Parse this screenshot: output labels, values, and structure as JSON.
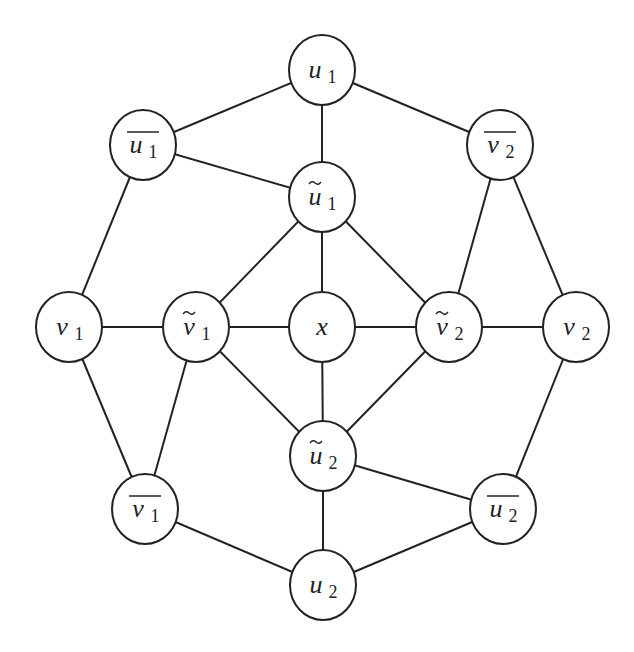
{
  "diagram": {
    "type": "graph",
    "style": {
      "edge_color": "#222222",
      "node_fill": "#ffffff",
      "node_stroke": "#222222",
      "node_radius": 33
    },
    "nodes": [
      {
        "id": "u1",
        "base": "u",
        "sub": "1",
        "decoration": "none",
        "x": 322,
        "y": 70
      },
      {
        "id": "u1bar",
        "base": "u",
        "sub": "1",
        "decoration": "bar",
        "x": 143,
        "y": 145
      },
      {
        "id": "v2bar",
        "base": "v",
        "sub": "2",
        "decoration": "bar",
        "x": 500,
        "y": 145
      },
      {
        "id": "u1tilde",
        "base": "u",
        "sub": "1",
        "decoration": "tilde",
        "x": 322,
        "y": 197
      },
      {
        "id": "v1",
        "base": "v",
        "sub": "1",
        "decoration": "none",
        "x": 69,
        "y": 327
      },
      {
        "id": "v1tilde",
        "base": "v",
        "sub": "1",
        "decoration": "tilde",
        "x": 196,
        "y": 327
      },
      {
        "id": "x",
        "base": "x",
        "sub": "",
        "decoration": "none",
        "x": 322,
        "y": 327
      },
      {
        "id": "v2tilde",
        "base": "v",
        "sub": "2",
        "decoration": "tilde",
        "x": 449,
        "y": 327
      },
      {
        "id": "v2",
        "base": "v",
        "sub": "2",
        "decoration": "none",
        "x": 576,
        "y": 327
      },
      {
        "id": "u2tilde",
        "base": "u",
        "sub": "2",
        "decoration": "tilde",
        "x": 323,
        "y": 456
      },
      {
        "id": "v1bar",
        "base": "v",
        "sub": "1",
        "decoration": "bar",
        "x": 145,
        "y": 509
      },
      {
        "id": "u2bar",
        "base": "u",
        "sub": "2",
        "decoration": "bar",
        "x": 503,
        "y": 509
      },
      {
        "id": "u2",
        "base": "u",
        "sub": "2",
        "decoration": "none",
        "x": 323,
        "y": 585
      }
    ],
    "edges": [
      [
        "u1",
        "u1bar"
      ],
      [
        "u1",
        "v2bar"
      ],
      [
        "u1",
        "u1tilde"
      ],
      [
        "u1bar",
        "u1tilde"
      ],
      [
        "u1bar",
        "v1"
      ],
      [
        "v2bar",
        "v2tilde"
      ],
      [
        "v2bar",
        "v2"
      ],
      [
        "u1tilde",
        "v1tilde"
      ],
      [
        "u1tilde",
        "x"
      ],
      [
        "u1tilde",
        "v2tilde"
      ],
      [
        "v1",
        "v1tilde"
      ],
      [
        "v1tilde",
        "x"
      ],
      [
        "x",
        "v2tilde"
      ],
      [
        "v2tilde",
        "v2"
      ],
      [
        "v1",
        "v1bar"
      ],
      [
        "v1tilde",
        "v1bar"
      ],
      [
        "v1tilde",
        "u2tilde"
      ],
      [
        "x",
        "u2tilde"
      ],
      [
        "v2tilde",
        "u2tilde"
      ],
      [
        "v2",
        "u2bar"
      ],
      [
        "u2tilde",
        "u2bar"
      ],
      [
        "u2tilde",
        "u2"
      ],
      [
        "v1bar",
        "u2"
      ],
      [
        "u2bar",
        "u2"
      ]
    ]
  }
}
